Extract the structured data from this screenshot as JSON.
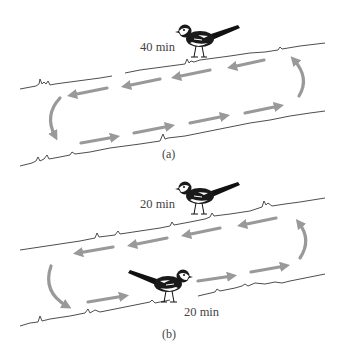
{
  "figure": {
    "arrow_color": "#999999",
    "line_color": "#3a3a3a",
    "background": "#ffffff"
  },
  "panels": [
    {
      "id": "a",
      "label": "(a)",
      "birds": [
        {
          "position": "upper-bank",
          "time_label": "40 min",
          "facing": "left"
        }
      ],
      "upper_arrows_direction": "left",
      "lower_arrows_direction": "right",
      "loop_direction": "counter-clockwise"
    },
    {
      "id": "b",
      "label": "(b)",
      "birds": [
        {
          "position": "upper-bank",
          "time_label": "20 min",
          "facing": "left"
        },
        {
          "position": "lower-bank",
          "time_label": "20 min",
          "facing": "right"
        }
      ],
      "upper_arrows_direction": "left",
      "lower_arrows_direction": "right",
      "loop_direction": "counter-clockwise"
    }
  ]
}
